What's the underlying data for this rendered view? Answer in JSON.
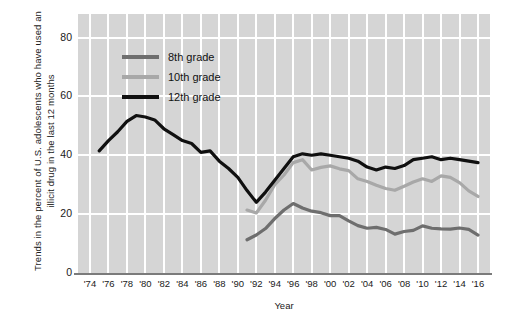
{
  "chart_data": {
    "type": "line",
    "title": "",
    "xlabel": "Year",
    "ylabel": "Trends in the percent of U.S. adolescents  who have used an illicit drug in the last 12 months",
    "xlim": [
      1974,
      2016
    ],
    "ylim": [
      0,
      88
    ],
    "yticks": [
      0,
      20,
      40,
      60,
      80
    ],
    "ytick_labels": [
      "0",
      "20",
      "40",
      "60",
      "80"
    ],
    "xticks": [
      1974,
      1976,
      1978,
      1980,
      1982,
      1984,
      1986,
      1988,
      1990,
      1992,
      1994,
      1996,
      1998,
      2000,
      2002,
      2004,
      2006,
      2008,
      2010,
      2012,
      2014,
      2016
    ],
    "xtick_labels": [
      "'74",
      "'76",
      "'78",
      "'80",
      "'82",
      "'84",
      "'86",
      "'88",
      "'90",
      "'92",
      "'94",
      "'96",
      "'98",
      "'00",
      "'02",
      "'04",
      "'06",
      "'08",
      "'10",
      "'12",
      "'14",
      "'16"
    ],
    "grid": true,
    "grid_color": "#ffffff",
    "plot_background": "#d5d5d5",
    "legend_position": "top-left-inside",
    "series": [
      {
        "name": "8th grade",
        "color": "#6e6e6e",
        "x": [
          1991,
          1992,
          1993,
          1994,
          1995,
          1996,
          1997,
          1998,
          1999,
          2000,
          2001,
          2002,
          2003,
          2004,
          2005,
          2006,
          2007,
          2008,
          2009,
          2010,
          2011,
          2012,
          2013,
          2014,
          2015,
          2016
        ],
        "values": [
          11.3,
          12.9,
          15.1,
          18.5,
          21.4,
          23.6,
          22.1,
          21.0,
          20.5,
          19.5,
          19.5,
          17.7,
          16.1,
          15.2,
          15.5,
          14.8,
          13.2,
          14.1,
          14.5,
          16.0,
          15.2,
          15.0,
          14.9,
          15.3,
          14.8,
          12.9
        ]
      },
      {
        "name": "10th grade",
        "color": "#a8a8a8",
        "x": [
          1991,
          1992,
          1993,
          1994,
          1995,
          1996,
          1997,
          1998,
          1999,
          2000,
          2001,
          2002,
          2003,
          2004,
          2005,
          2006,
          2007,
          2008,
          2009,
          2010,
          2011,
          2012,
          2013,
          2014,
          2015,
          2016
        ],
        "values": [
          21.4,
          20.4,
          24.7,
          30.0,
          33.3,
          37.5,
          38.5,
          35.0,
          35.9,
          36.4,
          35.4,
          34.8,
          32.0,
          31.1,
          29.8,
          28.7,
          28.1,
          29.5,
          30.9,
          32.0,
          31.1,
          33.0,
          32.5,
          30.7,
          27.9,
          26.0
        ]
      },
      {
        "name": "12th grade",
        "color": "#101010",
        "x": [
          1975,
          1976,
          1977,
          1978,
          1979,
          1980,
          1981,
          1982,
          1983,
          1984,
          1985,
          1986,
          1987,
          1988,
          1989,
          1990,
          1991,
          1992,
          1993,
          1994,
          1995,
          1996,
          1997,
          1998,
          1999,
          2000,
          2001,
          2002,
          2003,
          2004,
          2005,
          2006,
          2007,
          2008,
          2009,
          2010,
          2011,
          2012,
          2013,
          2014,
          2015,
          2016
        ],
        "values": [
          41.5,
          45.0,
          48.0,
          51.5,
          53.5,
          53.0,
          52.0,
          49.0,
          47.0,
          45.0,
          44.0,
          41.0,
          41.5,
          38.0,
          35.5,
          32.5,
          28.0,
          24.0,
          27.5,
          31.5,
          35.5,
          39.5,
          40.5,
          40.0,
          40.5,
          40.0,
          39.5,
          39.0,
          38.0,
          36.0,
          35.0,
          36.0,
          35.5,
          36.5,
          38.5,
          39.0,
          39.5,
          38.5,
          39.0,
          38.5,
          38.0,
          37.5
        ]
      }
    ]
  },
  "legend": {
    "items": [
      {
        "label": "8th grade",
        "color": "#6e6e6e"
      },
      {
        "label": "10th grade",
        "color": "#a8a8a8"
      },
      {
        "label": "12th grade",
        "color": "#101010"
      }
    ]
  },
  "axes": {
    "x_title": "Year",
    "y_title": "Trends in the percent of U.S. adolescents  who have used an illicit drug in the last 12 months"
  }
}
